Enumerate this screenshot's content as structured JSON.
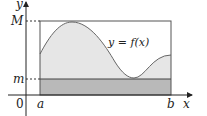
{
  "figure": {
    "type": "area-under-curve diagram",
    "axes": {
      "x_label": "x",
      "y_label": "y",
      "origin_label": "0"
    },
    "markers": {
      "upper_bound_label": "M",
      "lower_bound_label": "m",
      "left_endpoint_label": "a",
      "right_endpoint_label": "b"
    },
    "curve_label": "y = f(x)",
    "colors": {
      "curve_fill": "#e6e6e6",
      "lower_rect_fill": "#b9b9b9",
      "line": "#555555",
      "axis": "#222222"
    }
  }
}
